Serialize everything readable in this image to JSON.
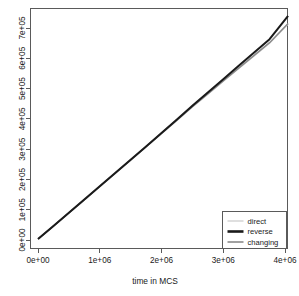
{
  "chart_data": {
    "type": "line",
    "title": "",
    "xlabel": "time in MCS",
    "ylabel": "",
    "xlim": [
      0,
      4150000
    ],
    "ylim": [
      0,
      755000
    ],
    "grid": false,
    "legend_position": "bottom-right",
    "xticks": [
      0,
      1000000,
      2000000,
      3000000,
      4000000
    ],
    "xtick_labels": [
      "0e+00",
      "1e+06",
      "2e+06",
      "3e+06",
      "4e+06"
    ],
    "yticks": [
      0,
      100000,
      200000,
      300000,
      400000,
      500000,
      600000,
      700000
    ],
    "ytick_labels": [
      "0e+00",
      "1e+05",
      "2e+05",
      "3e+05",
      "4e+05",
      "5e+05",
      "6e+05",
      "7e+05"
    ],
    "series": [
      {
        "name": "direct",
        "color": "#d8d8d8",
        "width": 1.4,
        "x": [
          0,
          250000,
          500000,
          750000,
          1000000,
          1250000,
          1500000,
          1750000,
          2000000,
          2250000,
          2500000,
          2750000,
          3000000,
          3250000,
          3500000,
          3750000,
          4050000
        ],
        "values": [
          3000,
          46000,
          89000,
          132000,
          176000,
          220000,
          263000,
          307000,
          351000,
          395000,
          439000,
          481000,
          524000,
          566000,
          608000,
          650000,
          713000
        ]
      },
      {
        "name": "reverse",
        "color": "#1a1a1a",
        "width": 2.0,
        "x": [
          0,
          250000,
          500000,
          750000,
          1000000,
          1250000,
          1500000,
          1750000,
          2000000,
          2250000,
          2500000,
          2750000,
          3000000,
          3250000,
          3500000,
          3750000,
          4050000
        ],
        "values": [
          3000,
          46500,
          90000,
          133500,
          177500,
          221500,
          265000,
          309000,
          353500,
          398000,
          443000,
          487000,
          531000,
          575000,
          619000,
          663000,
          740000
        ]
      },
      {
        "name": "changing",
        "color": "#8a8a8a",
        "width": 1.5,
        "x": [
          0,
          250000,
          500000,
          750000,
          1000000,
          1250000,
          1500000,
          1750000,
          2000000,
          2250000,
          2500000,
          2750000,
          3000000,
          3250000,
          3500000,
          3750000,
          4050000
        ],
        "values": [
          3000,
          46000,
          89500,
          132500,
          176500,
          220500,
          264000,
          308000,
          352000,
          396000,
          440000,
          482500,
          525500,
          567500,
          609500,
          651500,
          715000
        ]
      }
    ],
    "legend_entries": [
      {
        "label": "direct",
        "color": "#d8d8d8",
        "width": 1.6
      },
      {
        "label": "reverse",
        "color": "#1a1a1a",
        "width": 2.6
      },
      {
        "label": "changing",
        "color": "#8a8a8a",
        "width": 1.6
      }
    ]
  }
}
